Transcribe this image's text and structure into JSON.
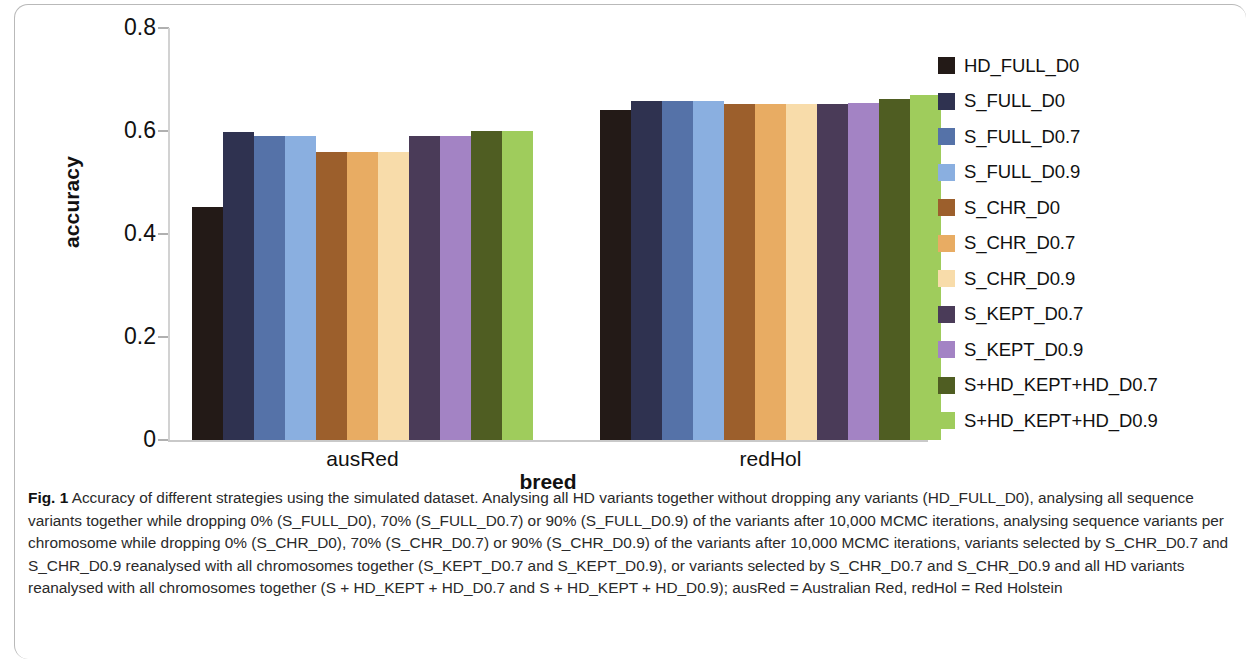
{
  "chart_data": {
    "type": "bar",
    "title": "",
    "xlabel": "breed",
    "ylabel": "accuracy",
    "categories": [
      "ausRed",
      "redHol"
    ],
    "ylim": [
      0,
      0.8
    ],
    "yticks": [
      0,
      0.2,
      0.4,
      0.6,
      0.8
    ],
    "ytick_labels": [
      "0",
      "0.2",
      "0.4",
      "0.6",
      "0.8"
    ],
    "grid": false,
    "legend_position": "right",
    "series": [
      {
        "name": "HD_FULL_D0",
        "color": "#231a17",
        "values": [
          0.452,
          0.64
        ]
      },
      {
        "name": "S_FULL_D0",
        "color": "#2f3250",
        "values": [
          0.598,
          0.659
        ]
      },
      {
        "name": "S_FULL_D0.7",
        "color": "#5572a8",
        "values": [
          0.59,
          0.659
        ]
      },
      {
        "name": "S_FULL_D0.9",
        "color": "#8aafe0",
        "values": [
          0.59,
          0.659
        ]
      },
      {
        "name": "S_CHR_D0",
        "color": "#9c5f2c",
        "values": [
          0.56,
          0.652
        ]
      },
      {
        "name": "S_CHR_D0.7",
        "color": "#e8ac63",
        "values": [
          0.56,
          0.652
        ]
      },
      {
        "name": "S_CHR_D0.9",
        "color": "#f8dcaa",
        "values": [
          0.56,
          0.652
        ]
      },
      {
        "name": "S_KEPT_D0.7",
        "color": "#4a3b58",
        "values": [
          0.59,
          0.652
        ]
      },
      {
        "name": "S_KEPT_D0.9",
        "color": "#a383c4",
        "values": [
          0.59,
          0.654
        ]
      },
      {
        "name": "S+HD_KEPT+HD_D0.7",
        "color": "#4f5d22",
        "values": [
          0.6,
          0.662
        ]
      },
      {
        "name": "S+HD_KEPT+HD_D0.9",
        "color": "#9fcc5c",
        "values": [
          0.6,
          0.67
        ]
      }
    ]
  },
  "axes": {
    "y_title": "accuracy",
    "x_title": "breed",
    "y_tick_labels": [
      "0.8",
      "0.6",
      "0.4",
      "0.2",
      "0"
    ],
    "x_tick_labels": [
      "ausRed",
      "redHol"
    ]
  },
  "legend": {
    "items": [
      {
        "label": "HD_FULL_D0",
        "color": "#231a17"
      },
      {
        "label": "S_FULL_D0",
        "color": "#2f3250"
      },
      {
        "label": "S_FULL_D0.7",
        "color": "#5572a8"
      },
      {
        "label": "S_FULL_D0.9",
        "color": "#8aafe0"
      },
      {
        "label": "S_CHR_D0",
        "color": "#9c5f2c"
      },
      {
        "label": "S_CHR_D0.7",
        "color": "#e8ac63"
      },
      {
        "label": "S_CHR_D0.9",
        "color": "#f8dcaa"
      },
      {
        "label": "S_KEPT_D0.7",
        "color": "#4a3b58"
      },
      {
        "label": "S_KEPT_D0.9",
        "color": "#a383c4"
      },
      {
        "label": "S+HD_KEPT+HD_D0.7",
        "color": "#4f5d22"
      },
      {
        "label": "S+HD_KEPT+HD_D0.9",
        "color": "#9fcc5c"
      }
    ]
  },
  "caption": {
    "figure_number": "Fig. 1",
    "text": "Accuracy of different strategies using the simulated dataset. Analysing all HD variants together without dropping any variants (HD_FULL_D0), analysing all sequence variants together while dropping 0% (S_FULL_D0), 70% (S_FULL_D0.7) or 90% (S_FULL_D0.9) of the variants after 10,000 MCMC iterations, analysing sequence variants per chromosome while dropping 0% (S_CHR_D0), 70% (S_CHR_D0.7) or 90% (S_CHR_D0.9) of the variants after 10,000 MCMC iterations, variants selected by S_CHR_D0.7 and S_CHR_D0.9 reanalysed with all chromosomes together (S_KEPT_D0.7 and S_KEPT_D0.9), or variants selected by S_CHR_D0.7 and S_CHR_D0.9 and all HD variants reanalysed with all chromosomes together (S + HD_KEPT + HD_D0.7 and S + HD_KEPT + HD_D0.9); ausRed = Australian Red, redHol = Red Holstein"
  }
}
